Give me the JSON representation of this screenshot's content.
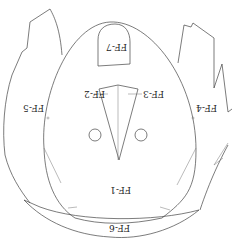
{
  "diagram": {
    "orientation": "upside-down",
    "stroke_color": "#444444",
    "labels": {
      "ff1": "FF-1",
      "ff2": "FF-2",
      "ff3": "FF-3",
      "ff4": "FF-4",
      "ff5": "FF-5",
      "ff6": "FF-6",
      "ff7": "FF-7"
    },
    "top_partial_text": "(cut-off caption)"
  }
}
